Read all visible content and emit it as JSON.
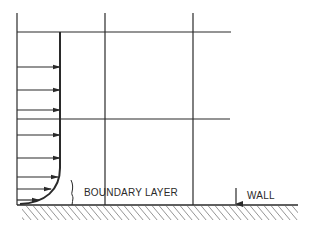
{
  "diagram": {
    "type": "boundary-layer velocity profile",
    "labels": {
      "boundary_layer": "BOUNDARY LAYER",
      "wall": "WALL"
    },
    "colors": {
      "line": "#2a2a2a",
      "background": "#ffffff"
    },
    "grid": {
      "vertical_lines_x": [
        17,
        105,
        193
      ],
      "horizontal_lines_y": [
        32,
        119
      ],
      "wall_y": 205
    },
    "velocity_arrows": [
      {
        "y": 67,
        "length": 43
      },
      {
        "y": 90,
        "length": 43
      },
      {
        "y": 110,
        "length": 43
      },
      {
        "y": 135,
        "length": 43
      },
      {
        "y": 158,
        "length": 43
      },
      {
        "y": 177,
        "length": 41
      },
      {
        "y": 189,
        "length": 34
      },
      {
        "y": 200,
        "length": 22
      }
    ]
  }
}
